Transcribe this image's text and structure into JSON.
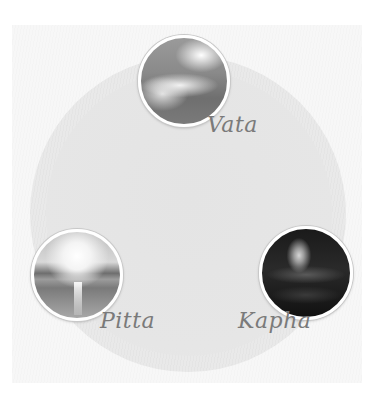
{
  "diagram": {
    "type": "three-node circular diagram",
    "nodes": [
      {
        "label": "Vata",
        "image": "clouds-sky-icon"
      },
      {
        "label": "Pitta",
        "image": "sunset-sea-icon"
      },
      {
        "label": "Kapha",
        "image": "water-drop-icon"
      }
    ]
  },
  "colors": {
    "background": "#ffffff",
    "panel": "#f7f7f7",
    "circle": "#e9e9e9",
    "label": "#7a7a7a"
  }
}
